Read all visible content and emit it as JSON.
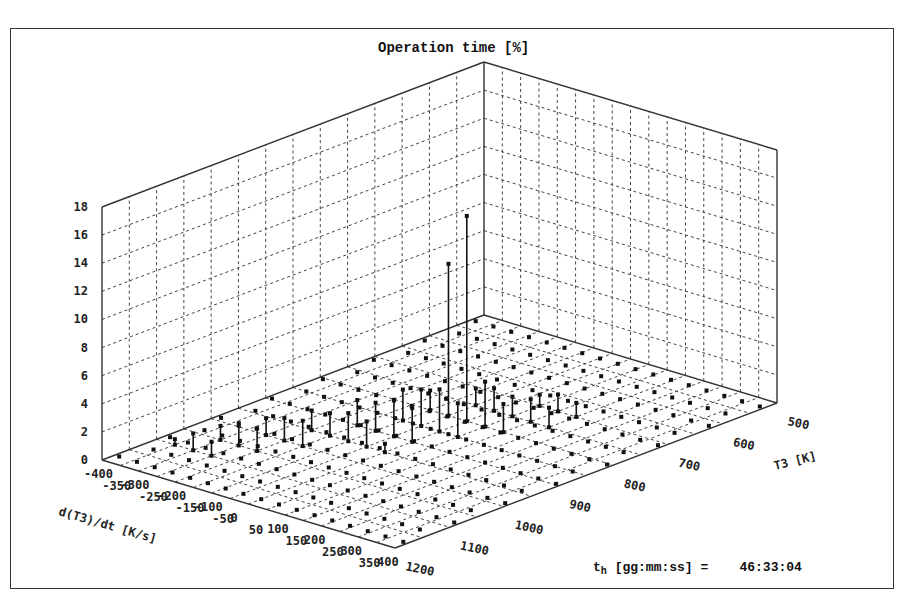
{
  "chart_data": {
    "type": "3d-stem",
    "title": "Operation time [%]",
    "zlabel": "Operation time [%]",
    "zlim": [
      0,
      18
    ],
    "z_ticks": [
      "0",
      "2",
      "4",
      "6",
      "8",
      "10",
      "12",
      "14",
      "16",
      "18"
    ],
    "x_axis": {
      "label": "d(T3)/dt  [K/s]",
      "ticks": [
        "-400",
        "-350",
        "-300",
        "-250",
        "-200",
        "-150",
        "-100",
        "-50",
        "0",
        "50",
        "100",
        "150",
        "200",
        "250",
        "300",
        "350",
        "400"
      ]
    },
    "y_axis": {
      "label": "T3 [K]",
      "ticks": [
        "1200",
        "1100",
        "1000",
        "900",
        "800",
        "700",
        "600",
        "500"
      ]
    },
    "grid": true,
    "points": [
      {
        "dTdt": 0,
        "T3": 800,
        "value": 14.6
      },
      {
        "dTdt": -50,
        "T3": 800,
        "value": 10.8
      },
      {
        "dTdt": 50,
        "T3": 800,
        "value": 3.2
      },
      {
        "dTdt": 0,
        "T3": 850,
        "value": 3.0
      },
      {
        "dTdt": -50,
        "T3": 850,
        "value": 2.6
      },
      {
        "dTdt": 50,
        "T3": 850,
        "value": 2.4
      },
      {
        "dTdt": 100,
        "T3": 800,
        "value": 2.0
      },
      {
        "dTdt": 100,
        "T3": 750,
        "value": 1.6
      },
      {
        "dTdt": -100,
        "T3": 850,
        "value": 2.2
      },
      {
        "dTdt": -100,
        "T3": 900,
        "value": 2.0
      },
      {
        "dTdt": -50,
        "T3": 900,
        "value": 2.6
      },
      {
        "dTdt": 0,
        "T3": 900,
        "value": 2.4
      },
      {
        "dTdt": -150,
        "T3": 900,
        "value": 1.8
      },
      {
        "dTdt": -150,
        "T3": 950,
        "value": 1.6
      },
      {
        "dTdt": -100,
        "T3": 950,
        "value": 2.0
      },
      {
        "dTdt": -50,
        "T3": 950,
        "value": 1.8
      },
      {
        "dTdt": -200,
        "T3": 950,
        "value": 1.4
      },
      {
        "dTdt": -200,
        "T3": 1000,
        "value": 1.6
      },
      {
        "dTdt": -150,
        "T3": 1000,
        "value": 1.8
      },
      {
        "dTdt": -250,
        "T3": 1000,
        "value": 1.2
      },
      {
        "dTdt": -250,
        "T3": 1050,
        "value": 1.4
      },
      {
        "dTdt": -200,
        "T3": 1050,
        "value": 1.6
      },
      {
        "dTdt": -300,
        "T3": 1050,
        "value": 1.0
      },
      {
        "dTdt": -300,
        "T3": 1100,
        "value": 1.2
      },
      {
        "dTdt": -250,
        "T3": 1100,
        "value": 1.0
      },
      {
        "dTdt": 150,
        "T3": 750,
        "value": 1.4
      },
      {
        "dTdt": 150,
        "T3": 700,
        "value": 1.0
      },
      {
        "dTdt": 100,
        "T3": 700,
        "value": 1.2
      },
      {
        "dTdt": 0,
        "T3": 750,
        "value": 1.6
      },
      {
        "dTdt": -50,
        "T3": 750,
        "value": 1.2
      },
      {
        "dTdt": 50,
        "T3": 750,
        "value": 1.4
      },
      {
        "dTdt": 50,
        "T3": 700,
        "value": 0.8
      },
      {
        "dTdt": -100,
        "T3": 800,
        "value": 1.4
      },
      {
        "dTdt": 0,
        "T3": 950,
        "value": 0.6
      },
      {
        "dTdt": -350,
        "T3": 1100,
        "value": 0.4
      }
    ]
  },
  "footer": {
    "label_main": "t",
    "label_sub": "h",
    "label_rest": " [gg:mm:ss] =    ",
    "value": "46:33:04"
  },
  "colors": {
    "stroke": "#333333",
    "grid": "#444444",
    "marker": "#111111",
    "background": "#ffffff"
  }
}
